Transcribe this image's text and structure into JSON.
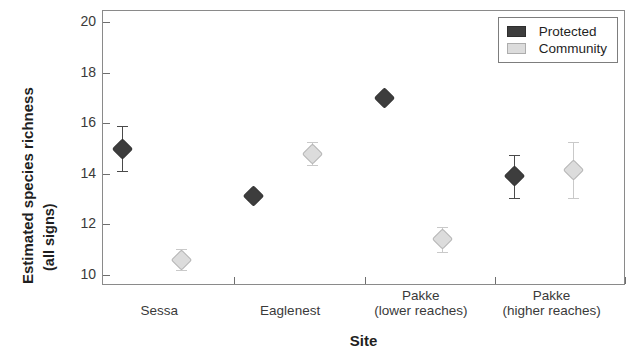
{
  "chart_data": {
    "type": "scatter",
    "title": "",
    "xlabel": "Site",
    "ylabel_line1": "Estimated species richness",
    "ylabel_line2": "(all signs)",
    "categories": [
      {
        "line1": "Sessa",
        "line2": ""
      },
      {
        "line1": "Eaglenest",
        "line2": ""
      },
      {
        "line1": "Pakke",
        "line2": "(lower reaches)"
      },
      {
        "line1": "Pakke",
        "line2": "(higher reaches)"
      }
    ],
    "ylim": [
      9.55,
      20.45
    ],
    "yticks": [
      20,
      18,
      16,
      14,
      12,
      10
    ],
    "grid": false,
    "legend_position": "top-right",
    "series": [
      {
        "name": "Protected",
        "color": "#3d3d3d",
        "marker": "diamond",
        "values": [
          15.0,
          13.1,
          17.0,
          13.9
        ],
        "err_low": [
          14.1,
          12.95,
          17.0,
          13.05
        ],
        "err_high": [
          15.9,
          13.25,
          17.0,
          14.75
        ]
      },
      {
        "name": "Community",
        "color": "#dcdcdc",
        "marker": "diamond",
        "values": [
          10.6,
          14.8,
          11.4,
          14.15
        ],
        "err_low": [
          10.2,
          14.35,
          10.9,
          13.05
        ],
        "err_high": [
          11.0,
          15.25,
          11.9,
          15.25
        ]
      }
    ]
  },
  "legend": {
    "items": [
      {
        "label": "Protected",
        "swatch": "protected"
      },
      {
        "label": "Community",
        "swatch": "community"
      }
    ]
  }
}
